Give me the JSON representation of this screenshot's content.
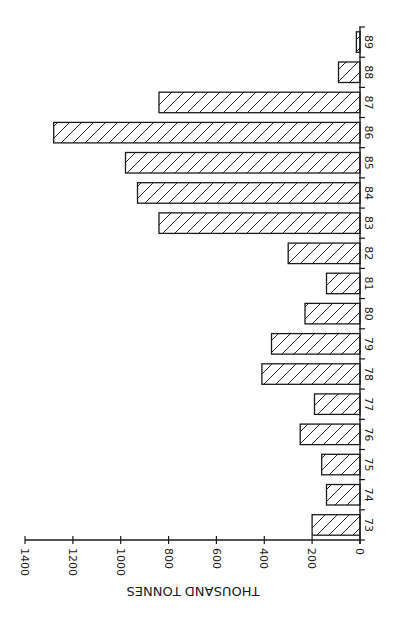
{
  "chart_data": {
    "type": "bar",
    "orientation": "rotated-90-clockwise",
    "title": "",
    "xlabel": "",
    "ylabel": "THOUSAND TONNES",
    "categories": [
      "73",
      "74",
      "75",
      "76",
      "77",
      "78",
      "79",
      "80",
      "81",
      "82",
      "83",
      "84",
      "85",
      "86",
      "87",
      "88",
      "89"
    ],
    "values": [
      200,
      140,
      160,
      250,
      190,
      410,
      370,
      230,
      140,
      300,
      840,
      930,
      980,
      1280,
      840,
      90,
      15
    ],
    "ylim": [
      0,
      1400
    ],
    "yticks": [
      0,
      200,
      400,
      600,
      800,
      1000,
      1200,
      1400
    ],
    "grid": false,
    "legend": null,
    "bar_fill": "diagonal-hatch",
    "colors": {
      "stroke": "#1a1a1a",
      "background": "#ffffff"
    }
  },
  "axis_title": "THOUSAND TONNES"
}
